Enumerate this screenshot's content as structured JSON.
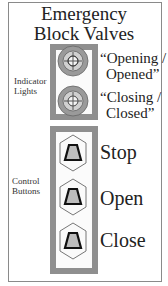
{
  "title": {
    "line1": "Emergency",
    "line2": "Block Valves"
  },
  "indicator_section": {
    "label_line1": "Indicator",
    "label_line2": "Lights",
    "lights": [
      {
        "icon": "indicator-light-icon",
        "label_line1": "“Opening /",
        "label_line2": "Opened”"
      },
      {
        "icon": "indicator-light-icon",
        "label_line1": "“Closing /",
        "label_line2": "Closed”"
      }
    ]
  },
  "control_section": {
    "label_line1": "Control",
    "label_line2": "Buttons",
    "buttons": [
      {
        "icon": "hex-pushbutton-icon",
        "label": "Stop"
      },
      {
        "icon": "hex-pushbutton-icon",
        "label": "Open"
      },
      {
        "icon": "hex-pushbutton-icon",
        "label": "Close"
      }
    ]
  },
  "colors": {
    "panel": "#8f8f8f",
    "light_ring": "#9a9a9a",
    "light_face": "#c8c8c8",
    "button_face": "#b8b8b8"
  }
}
